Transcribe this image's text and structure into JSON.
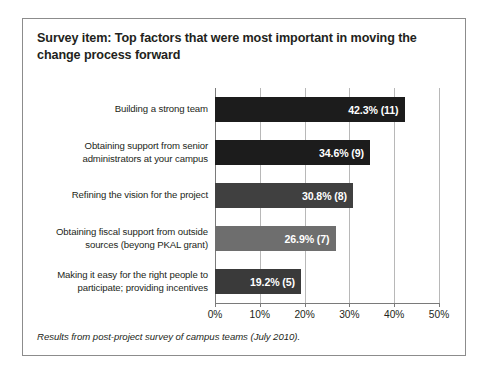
{
  "figure": {
    "title": "Survey item: Top factors that were most important in moving the change process forward",
    "footnote": "Results from post-project survey of campus teams (July 2010)."
  },
  "chart_data": {
    "type": "bar",
    "orientation": "horizontal",
    "title": "Survey item: Top factors that were most important in moving the change process forward",
    "xlabel": "",
    "ylabel": "",
    "xlim": [
      0,
      50
    ],
    "xticks": [
      0,
      10,
      20,
      30,
      40,
      50
    ],
    "xtick_labels": [
      "0%",
      "10%",
      "20%",
      "30%",
      "40%",
      "50%"
    ],
    "grid": true,
    "legend": false,
    "categories": [
      "Building a strong team",
      "Obtaining support from senior administrators at your campus",
      "Refining the vision for the project",
      "Obtaining fiscal support from outside sources (beyong PKAL grant)",
      "Making it easy for the right people to participate; providing incentives"
    ],
    "values": [
      42.3,
      34.6,
      30.8,
      26.9,
      19.2
    ],
    "counts": [
      11,
      9,
      8,
      7,
      5
    ],
    "data_labels": [
      "42.3% (11)",
      "34.6% (9)",
      "30.8% (8)",
      "26.9% (7)",
      "19.2% (5)"
    ],
    "bar_colors": [
      "#1c1c1c",
      "#1c1c1c",
      "#404040",
      "#6e6e6e",
      "#3a3a3a"
    ],
    "bars": [
      {
        "label_line1": "Building a strong team",
        "label_line2": "",
        "value": 42.3,
        "count": 11,
        "data_label": "42.3% (11)",
        "color": "#1c1c1c"
      },
      {
        "label_line1": "Obtaining support from senior",
        "label_line2": "administrators at your campus",
        "value": 34.6,
        "count": 9,
        "data_label": "34.6% (9)",
        "color": "#1c1c1c"
      },
      {
        "label_line1": "Refining the vision for the project",
        "label_line2": "",
        "value": 30.8,
        "count": 8,
        "data_label": "30.8% (8)",
        "color": "#404040"
      },
      {
        "label_line1": "Obtaining fiscal support from outside",
        "label_line2": "sources (beyong PKAL grant)",
        "value": 26.9,
        "count": 7,
        "data_label": "26.9% (7)",
        "color": "#6e6e6e"
      },
      {
        "label_line1": "Making it easy for the right people to",
        "label_line2": "participate; providing incentives",
        "value": 19.2,
        "count": 5,
        "data_label": "19.2% (5)",
        "color": "#3a3a3a"
      }
    ]
  },
  "axis": {
    "ticks": [
      {
        "label": "0%",
        "value": 0
      },
      {
        "label": "10%",
        "value": 10
      },
      {
        "label": "20%",
        "value": 20
      },
      {
        "label": "30%",
        "value": 30
      },
      {
        "label": "40%",
        "value": 40
      },
      {
        "label": "50%",
        "value": 50
      }
    ]
  }
}
